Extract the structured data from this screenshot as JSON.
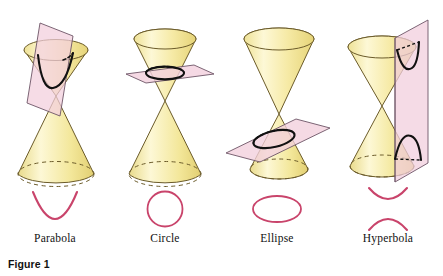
{
  "figure": {
    "caption": "Figure 1",
    "background_color": "#ffffff"
  },
  "palette": {
    "cone_fill_light": "#fdf6cd",
    "cone_fill_mid": "#f3e79a",
    "cone_fill_dark": "#e8d77c",
    "cone_outline": "#6b5b2a",
    "plane_fill": "#f2cfdd",
    "plane_outline": "#7a6070",
    "intersection_curve": "#111111",
    "conic_curve": "#c9446b",
    "label_text": "#111111",
    "caption_text": "#111111"
  },
  "panels": [
    {
      "id": "parabola",
      "label": "Parabola",
      "cone_name": "double-cone",
      "plane_name": "cutting-plane-parabola",
      "plane_orientation": "oblique-parallel-to-slant",
      "intersection_name": "parabola-intersection-curve",
      "curve_name": "parabola-curve"
    },
    {
      "id": "circle",
      "label": "Circle",
      "cone_name": "double-cone",
      "plane_name": "cutting-plane-circle",
      "plane_orientation": "horizontal-perpendicular-to-axis",
      "intersection_name": "circle-intersection-curve",
      "curve_name": "circle-curve"
    },
    {
      "id": "ellipse",
      "label": "Ellipse",
      "cone_name": "double-cone",
      "plane_name": "cutting-plane-ellipse",
      "plane_orientation": "oblique-cuts-one-nappe",
      "intersection_name": "ellipse-intersection-curve",
      "curve_name": "ellipse-curve"
    },
    {
      "id": "hyperbola",
      "label": "Hyperbola",
      "cone_name": "double-cone",
      "plane_name": "cutting-plane-hyperbola",
      "plane_orientation": "vertical-parallel-to-axis",
      "intersection_name": "hyperbola-intersection-curve",
      "curve_name": "hyperbola-curve"
    }
  ]
}
